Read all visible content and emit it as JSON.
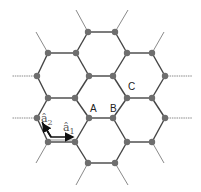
{
  "diagram": {
    "type": "honeycomb-lattice",
    "colors": {
      "bond": "#444444",
      "node": "#6e6e6e",
      "stub": "#8a8a8a",
      "arrow": "#111111"
    },
    "nodes": [
      [
        88,
        32
      ],
      [
        115,
        32
      ],
      [
        48,
        53
      ],
      [
        76,
        53
      ],
      [
        127,
        53
      ],
      [
        152,
        53
      ],
      [
        37,
        76
      ],
      [
        89,
        76
      ],
      [
        113,
        76
      ],
      [
        165,
        76
      ],
      [
        48,
        98
      ],
      [
        75,
        98
      ],
      [
        127,
        98
      ],
      [
        152,
        98
      ],
      [
        37,
        118
      ],
      [
        89,
        118
      ],
      [
        113,
        118
      ],
      [
        165,
        118
      ],
      [
        48,
        142
      ],
      [
        75,
        142
      ],
      [
        127,
        142
      ],
      [
        152,
        142
      ],
      [
        88,
        163
      ],
      [
        115,
        163
      ]
    ],
    "bonds": [
      [
        0,
        1
      ],
      [
        0,
        3
      ],
      [
        1,
        4
      ],
      [
        2,
        3
      ],
      [
        4,
        5
      ],
      [
        2,
        6
      ],
      [
        3,
        7
      ],
      [
        4,
        8
      ],
      [
        5,
        9
      ],
      [
        7,
        8
      ],
      [
        6,
        10
      ],
      [
        7,
        11
      ],
      [
        8,
        12
      ],
      [
        9,
        13
      ],
      [
        10,
        11
      ],
      [
        12,
        13
      ],
      [
        10,
        14
      ],
      [
        11,
        15
      ],
      [
        12,
        16
      ],
      [
        13,
        17
      ],
      [
        15,
        16
      ],
      [
        14,
        18
      ],
      [
        15,
        19
      ],
      [
        16,
        20
      ],
      [
        17,
        21
      ],
      [
        18,
        19
      ],
      [
        20,
        21
      ],
      [
        19,
        22
      ],
      [
        20,
        23
      ],
      [
        22,
        23
      ]
    ],
    "stubs": [
      [
        88,
        32,
        76,
        10
      ],
      [
        115,
        32,
        128,
        10
      ],
      [
        48,
        53,
        36,
        32
      ],
      [
        152,
        53,
        164,
        32
      ],
      [
        37,
        76,
        12,
        76
      ],
      [
        165,
        76,
        192,
        76
      ],
      [
        37,
        118,
        12,
        118
      ],
      [
        165,
        118,
        192,
        118
      ],
      [
        48,
        142,
        36,
        163
      ],
      [
        152,
        142,
        164,
        163
      ],
      [
        88,
        163,
        76,
        185
      ],
      [
        115,
        163,
        128,
        185
      ]
    ],
    "labels": [
      {
        "text": "A",
        "x": 90,
        "y": 104
      },
      {
        "text": "B",
        "x": 110,
        "y": 104
      },
      {
        "text": "C",
        "x": 128,
        "y": 82
      }
    ],
    "vectors": [
      {
        "name": "a1",
        "label": "â",
        "sub": "1",
        "x": 63,
        "y": 122
      },
      {
        "name": "a2",
        "label": "â",
        "sub": "2",
        "x": 41,
        "y": 113
      }
    ]
  }
}
